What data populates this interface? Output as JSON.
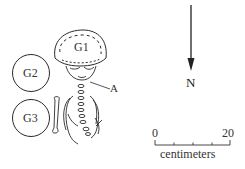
{
  "figure": {
    "labels": {
      "g1": "G1",
      "g2": "G2",
      "g3": "G3",
      "a": "A"
    },
    "north_arrow": {
      "label": "N",
      "direction": "down"
    },
    "scale_bar": {
      "start": "0",
      "end": "20",
      "unit": "centimeters",
      "divisions": 4
    },
    "colors": {
      "line": "#2a2a2a",
      "background": "#ffffff"
    }
  }
}
